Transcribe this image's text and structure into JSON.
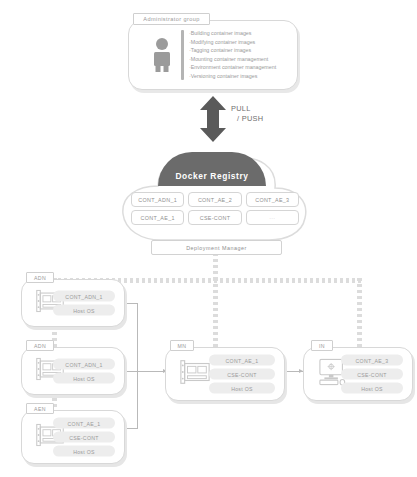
{
  "admin": {
    "tag": "Administrator group",
    "icon": "person-icon",
    "tasks": [
      "·Building   container images",
      "·Modifying container images",
      "·Tagging   container images",
      "·Mounting  container management",
      "·Environment  container management",
      "·Versioning container images"
    ]
  },
  "transfer": {
    "label_line1": "PULL",
    "label_line2": "/ PUSH",
    "arrow_icon": "double-arrow-vertical-icon",
    "arrow_color": "#5a5a5a"
  },
  "registry": {
    "title": "Docker Registry",
    "title_bg": "#6b6b6b",
    "images": [
      {
        "label": "CONT_ADN_1",
        "faint": false
      },
      {
        "label": "CONT_AE_2",
        "faint": false
      },
      {
        "label": "CONT_AE_3",
        "faint": false
      },
      {
        "label": "CONT_AE_1",
        "faint": false
      },
      {
        "label": "CSE-CONT",
        "faint": false
      },
      {
        "label": "···",
        "faint": true
      }
    ],
    "deployment_manager": "Deployment Manager"
  },
  "nodes": [
    {
      "tag": "ADN",
      "icon": "network-card-icon",
      "chips": [
        "CONT_ADN_1",
        "Host OS"
      ]
    },
    {
      "tag": "ADN",
      "icon": "network-card-icon",
      "chips": [
        "CONT_ADN_1",
        "Host OS"
      ]
    },
    {
      "tag": "AEN",
      "icon": "network-card-icon",
      "chips": [
        "CONT_AE_1",
        "CSE-CONT",
        "Host OS"
      ]
    },
    {
      "tag": "MN",
      "icon": "network-card-icon",
      "chips": [
        "CONT_AE_1",
        "CSE-CONT",
        "Host OS"
      ]
    },
    {
      "tag": "IN",
      "icon": "desktop-monitor-icon",
      "chips": [
        "CONT_AE_3",
        "CSE-CONT",
        "Host OS"
      ]
    }
  ]
}
